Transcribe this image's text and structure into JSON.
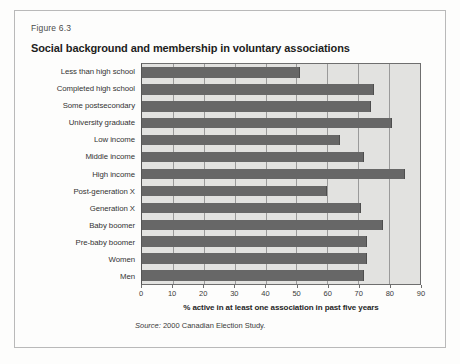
{
  "figure": {
    "number": "Figure 6.3",
    "title": "Social background and membership in voluntary associations",
    "source_prefix": "Source:",
    "source_text": " 2000 Canadian Election Study."
  },
  "colors": {
    "bar": "#676767",
    "plot_background": "#e2e2e0",
    "gridline": "#9a9a9a",
    "card_border": "#b9b9b9",
    "text": "#333333"
  },
  "chart_data": {
    "type": "bar",
    "orientation": "horizontal",
    "title": "Social background and membership in voluntary associations",
    "xlabel": "% active in at least one association in past five years",
    "ylabel": "",
    "xlim": [
      0,
      90
    ],
    "xticks": [
      0,
      10,
      20,
      30,
      40,
      50,
      60,
      70,
      80,
      90
    ],
    "grid": true,
    "legend": false,
    "categories": [
      "Less than high school",
      "Completed high school",
      "Some postsecondary",
      "University graduate",
      "Low income",
      "Middle income",
      "High income",
      "Post-generation X",
      "Generation X",
      "Baby boomer",
      "Pre-baby boomer",
      "Women",
      "Men"
    ],
    "values": [
      51,
      75,
      74,
      81,
      64,
      72,
      85,
      60,
      71,
      78,
      73,
      73,
      72
    ]
  }
}
